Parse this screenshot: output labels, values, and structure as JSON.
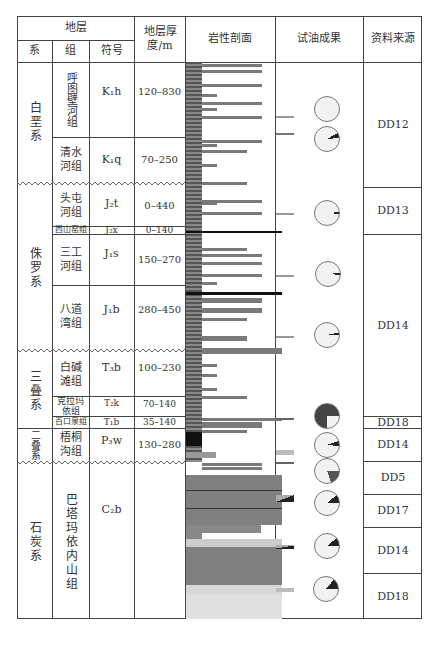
{
  "header": {
    "strata": "地层",
    "system": "系",
    "formation": "组",
    "symbol": "符号",
    "thickness": "地层厚度/m",
    "lithology": "岩性剖面",
    "oil_test": "试油成果",
    "source": "资料来源"
  },
  "systems": [
    {
      "name": "白垩系"
    },
    {
      "name": "侏罗系"
    },
    {
      "name": "三叠系"
    },
    {
      "name": "二叠系"
    },
    {
      "name": "石炭系"
    }
  ],
  "formations": [
    {
      "name": "呼图壁河组",
      "symbol": "K₁h",
      "thickness": "120–830"
    },
    {
      "name": "清水河组",
      "symbol": "K₁q",
      "thickness": "70–250"
    },
    {
      "name": "头屯河组",
      "symbol": "J₂t",
      "thickness": "0–440"
    },
    {
      "name": "西山窑组",
      "symbol": "J₂x",
      "thickness": "0–140"
    },
    {
      "name": "三工河组",
      "symbol": "J₁s",
      "thickness": "150–270"
    },
    {
      "name": "八道湾组",
      "symbol": "J₁b",
      "thickness": "280–450"
    },
    {
      "name": "白碱滩组",
      "symbol": "T₃b",
      "thickness": "100–230"
    },
    {
      "name": "克拉玛依组",
      "symbol": "T₂k",
      "thickness": "70–140"
    },
    {
      "name": "百口泉组",
      "symbol": "T₁b",
      "thickness": "35–140"
    },
    {
      "name": "梧桐沟组",
      "symbol": "P₃w",
      "thickness": "130–280"
    },
    {
      "name": "巴塔玛依内山组",
      "symbol": "C₂b",
      "thickness": ""
    }
  ],
  "sources": [
    "DD12",
    "DD13",
    "DD14",
    "DD18",
    "DD14",
    "DD5",
    "DD17",
    "DD14",
    "DD18"
  ],
  "oil_test_pies": [
    {
      "y": 137,
      "fill_pct": 0,
      "color": "#222"
    },
    {
      "y": 167,
      "fill_pct": 7,
      "color": "#222"
    },
    {
      "y": 214,
      "fill_pct": 2,
      "color": "#222"
    },
    {
      "y": 273,
      "fill_pct": 3,
      "color": "#222"
    },
    {
      "y": 334,
      "fill_pct": 3,
      "color": "#222"
    },
    {
      "y": 413,
      "fill_pct": 75,
      "color": "#444"
    },
    {
      "y": 442,
      "fill_pct": 7,
      "color": "#222"
    },
    {
      "y": 471,
      "fill_pct": 20,
      "color": "#555"
    },
    {
      "y": 503,
      "fill_pct": 12,
      "color": "#222"
    },
    {
      "y": 546,
      "fill_pct": 12,
      "color": "#222"
    },
    {
      "y": 587,
      "fill_pct": 14,
      "color": "#222"
    }
  ],
  "colors": {
    "border": "#444444",
    "fill_gray": "#7a7a7a",
    "pie_bg": "#f2f2f2"
  }
}
